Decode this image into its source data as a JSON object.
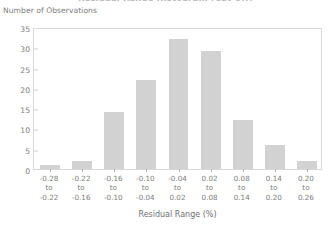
{
  "chart_data": {
    "type": "bar",
    "title": "Residual Range Histogram (Cut Off)",
    "ylabel": "Number of Observations",
    "xlabel": "Residual Range (%)",
    "categories": [
      "-0.28 to -0.22",
      "-0.22 to -0.16",
      "-0.16 to -0.10",
      "-0.10 to -0.04",
      "-0.04 to 0.02",
      "0.02 to 0.08",
      "0.08 to 0.14",
      "0.14 to 0.20",
      "0.20 to 0.26"
    ],
    "category_lines": [
      {
        "from": "-0.28",
        "to_word": "to",
        "to": "-0.22"
      },
      {
        "from": "-0.22",
        "to_word": "to",
        "to": "-0.16"
      },
      {
        "from": "-0.16",
        "to_word": "to",
        "to": "-0.10"
      },
      {
        "from": "-0.10",
        "to_word": "to",
        "to": "-0.04"
      },
      {
        "from": "-0.04",
        "to_word": "to",
        "to": "0.02"
      },
      {
        "from": "0.02",
        "to_word": "to",
        "to": "0.08"
      },
      {
        "from": "0.08",
        "to_word": "to",
        "to": "0.14"
      },
      {
        "from": "0.14",
        "to_word": "to",
        "to": "0.20"
      },
      {
        "from": "0.20",
        "to_word": "to",
        "to": "0.26"
      }
    ],
    "values": [
      1,
      2,
      14,
      22,
      32,
      29,
      12,
      6,
      2
    ],
    "ylim": [
      0,
      35
    ],
    "yticks": [
      0,
      5,
      10,
      15,
      20,
      25,
      30,
      35
    ],
    "grid": false,
    "legend": "none",
    "bar_color": "#d2d2d2",
    "axis_color": "#d8d8d8",
    "text_color": "#7d7d7d"
  }
}
